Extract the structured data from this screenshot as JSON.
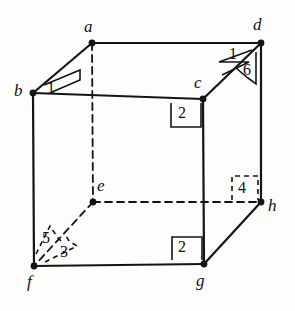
{
  "figure": {
    "kind": "geometric-diagram",
    "shape": "cube",
    "projection": "oblique",
    "stroke_color": "#141414",
    "background_color": "#fdfdfb",
    "solid_edge_width": 2.2,
    "hidden_edge_width": 1.8,
    "hidden_edge_dash": "7,5",
    "marker_width": 1.6,
    "vertex_dot_radius": 3.4
  },
  "vertices": [
    {
      "id": "a",
      "label": "a",
      "x": 92,
      "y": 43,
      "label_x": 84,
      "label_y": 18,
      "hidden": false
    },
    {
      "id": "b",
      "label": "b",
      "x": 33,
      "y": 93,
      "label_x": 14,
      "label_y": 82,
      "hidden": false
    },
    {
      "id": "c",
      "label": "c",
      "x": 203,
      "y": 99,
      "label_x": 194,
      "label_y": 74,
      "hidden": false
    },
    {
      "id": "d",
      "label": "d",
      "x": 261,
      "y": 43,
      "label_x": 253,
      "label_y": 16,
      "hidden": false
    },
    {
      "id": "e",
      "label": "e",
      "x": 93,
      "y": 202,
      "label_x": 97,
      "label_y": 177,
      "hidden": true
    },
    {
      "id": "f",
      "label": "f",
      "x": 34,
      "y": 266,
      "label_x": 27,
      "label_y": 273,
      "hidden": false
    },
    {
      "id": "g",
      "label": "g",
      "x": 204,
      "y": 264,
      "label_x": 196,
      "label_y": 272,
      "hidden": false
    },
    {
      "id": "h",
      "label": "h",
      "x": 261,
      "y": 202,
      "label_x": 268,
      "label_y": 197,
      "hidden": false
    }
  ],
  "edges": [
    {
      "id": "b-c",
      "from": "b",
      "to": "c",
      "style": "solid",
      "x1": 33,
      "y1": 93,
      "x2": 203,
      "y2": 99
    },
    {
      "id": "c-g",
      "from": "c",
      "to": "g",
      "style": "solid",
      "x1": 203,
      "y1": 99,
      "x2": 204,
      "y2": 264
    },
    {
      "id": "g-f",
      "from": "g",
      "to": "f",
      "style": "solid",
      "x1": 204,
      "y1": 264,
      "x2": 34,
      "y2": 266
    },
    {
      "id": "f-b",
      "from": "f",
      "to": "b",
      "style": "solid",
      "x1": 34,
      "y1": 266,
      "x2": 33,
      "y2": 93
    },
    {
      "id": "a-d",
      "from": "a",
      "to": "d",
      "style": "solid",
      "x1": 92,
      "y1": 43,
      "x2": 261,
      "y2": 43
    },
    {
      "id": "d-h",
      "from": "d",
      "to": "h",
      "style": "solid",
      "x1": 261,
      "y1": 43,
      "x2": 261,
      "y2": 202
    },
    {
      "id": "b-a",
      "from": "b",
      "to": "a",
      "style": "solid",
      "x1": 33,
      "y1": 93,
      "x2": 92,
      "y2": 43
    },
    {
      "id": "c-d",
      "from": "c",
      "to": "d",
      "style": "solid",
      "x1": 203,
      "y1": 99,
      "x2": 261,
      "y2": 43
    },
    {
      "id": "g-h",
      "from": "g",
      "to": "h",
      "style": "solid",
      "x1": 204,
      "y1": 264,
      "x2": 261,
      "y2": 202
    },
    {
      "id": "a-e",
      "from": "a",
      "to": "e",
      "style": "dashed",
      "x1": 92,
      "y1": 43,
      "x2": 93,
      "y2": 202
    },
    {
      "id": "e-h",
      "from": "e",
      "to": "h",
      "style": "dashed",
      "x1": 93,
      "y1": 202,
      "x2": 261,
      "y2": 202
    },
    {
      "id": "e-f",
      "from": "e",
      "to": "f",
      "style": "dashed",
      "x1": 93,
      "y1": 202,
      "x2": 34,
      "y2": 266
    }
  ],
  "angle_markers": [
    {
      "id": "angle-1-at-b",
      "label": "1",
      "at_vertex": "b",
      "marker_type": "wedge",
      "style": "solid",
      "label_x": 47,
      "label_y": 80,
      "path": "M 44 85 L 80 70 L 80 80 L 52 92"
    },
    {
      "id": "angle-1-at-d",
      "label": "1",
      "at_vertex": "d",
      "marker_type": "wedge",
      "style": "solid",
      "label_x": 229,
      "label_y": 46,
      "path": "M 252 50 L 219 62 L 249 62 L 222 75"
    },
    {
      "id": "angle-6-at-d",
      "label": "6",
      "at_vertex": "d",
      "marker_type": "wedge",
      "style": "solid",
      "label_x": 243,
      "label_y": 62,
      "path": "M 256 52 L 256 84 L 248 78 L 236 68"
    },
    {
      "id": "angle-2-at-c",
      "label": "2",
      "at_vertex": "c",
      "marker_type": "right-angle-square",
      "style": "solid",
      "label_x": 178,
      "label_y": 105,
      "path": "M 201 103 L 201 127 L 171 127 L 171 103"
    },
    {
      "id": "angle-4-at-h",
      "label": "4",
      "at_vertex": "h",
      "marker_type": "right-angle-square",
      "style": "dashed",
      "label_x": 238,
      "label_y": 180,
      "path": "M 232 200 L 232 176 L 258 176 L 258 200"
    },
    {
      "id": "angle-2-at-g",
      "label": "2",
      "at_vertex": "g",
      "marker_type": "right-angle-square",
      "style": "solid",
      "label_x": 178,
      "label_y": 239,
      "path": "M 202 260 L 202 237 L 172 237 L 172 260"
    },
    {
      "id": "angle-5-at-f",
      "label": "5",
      "at_vertex": "f",
      "marker_type": "wedge",
      "style": "dashed",
      "label_x": 42,
      "label_y": 230,
      "path": "M 36 254 L 50 226 L 58 238 L 64 244"
    },
    {
      "id": "angle-3-at-f",
      "label": "3",
      "at_vertex": "f",
      "marker_type": "wedge",
      "style": "dashed",
      "label_x": 60,
      "label_y": 244,
      "path": "M 45 262 L 77 246 L 69 241 L 66 236"
    }
  ]
}
